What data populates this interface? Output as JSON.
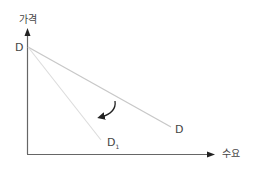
{
  "diagram": {
    "y_axis_label": "가격",
    "x_axis_label": "수요",
    "intercept_label": "D",
    "curves": [
      {
        "name": "D",
        "label": "D",
        "from": [
          28,
          47
        ],
        "to": [
          171,
          127
        ],
        "color": "#c8c8c8"
      },
      {
        "name": "D1",
        "label": "D",
        "subscript": "1",
        "from": [
          28,
          47
        ],
        "to": [
          101,
          140
        ],
        "color": "#dcdcdc"
      }
    ],
    "arrow": {
      "meaning": "rotation from D to D1",
      "color": "#222222"
    },
    "axis_color": "#666666"
  }
}
